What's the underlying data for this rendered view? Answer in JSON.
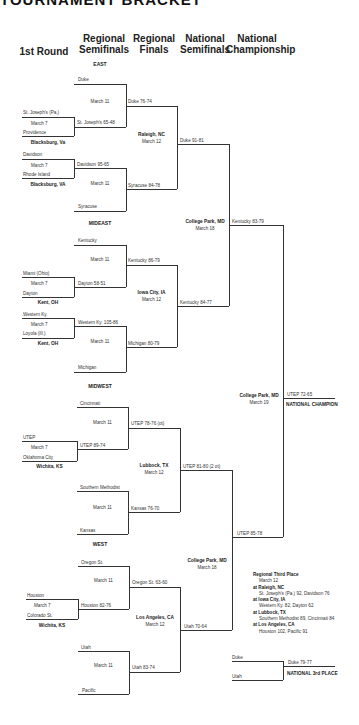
{
  "title": "TOURNAMENT BRACKET",
  "headers": [
    "1st Round",
    "Regional Semifinals",
    "Regional Finals",
    "National Semifinals",
    "National Championship"
  ],
  "regions": [
    "EAST",
    "MIDEAST",
    "MIDWEST",
    "WEST"
  ],
  "east": {
    "r1a": {
      "top": "St. Joseph's (Pa.)",
      "date": "March 7",
      "bottom": "Providence",
      "site": "Blacksburg, Va"
    },
    "r1b": {
      "top": "Davidson",
      "date": "March 7",
      "bottom": "Rhode Island",
      "site": "Blacksburg, VA"
    },
    "sf1": {
      "top": "Duke",
      "date": "March 11",
      "winner_bottom": "St. Joseph's 65-48"
    },
    "sf2": {
      "top": "Davidson 95-65",
      "date": "March 11",
      "bottom": "Syracuse"
    },
    "final": {
      "top": "Duke 76-74",
      "bottom": "Syracuse 84-78",
      "site": "Raleigh, NC",
      "date": "March 12"
    }
  },
  "mideast": {
    "r1a": {
      "top": "Miami (Ohio)",
      "date": "March 7",
      "bottom": "Dayton",
      "site": "Kent, OH"
    },
    "r1b": {
      "top": "Western Ky.",
      "date": "March 7",
      "bottom": "Loyola (Ill.)",
      "site": "Kent, OH"
    },
    "sf1": {
      "top": "Kentucky",
      "date": "March 11",
      "bottom": "Dayton 58-51"
    },
    "sf2": {
      "top": "Western Ky. 105-86",
      "date": "March 11",
      "bottom": "Michigan"
    },
    "final": {
      "top": "Kentucky 86-79",
      "bottom": "Michigan 80-79",
      "site": "Iowa City, IA",
      "date": "March 12"
    }
  },
  "midwest": {
    "r1a": {
      "top": "UTEP",
      "date": "March 7",
      "bottom": "Oklahoma City",
      "site": "Wichita, KS"
    },
    "sf1": {
      "top": "Cincinnati",
      "date": "March 11",
      "bottom": "UTEP 89-74"
    },
    "sf2": {
      "top": "Southern Methodist",
      "date": "March 11",
      "bottom": "Kansas"
    },
    "final": {
      "top": "UTEP 78-76 (ot)",
      "bottom": "Kansas 76-70",
      "site": "Lubbock, TX",
      "date": "March 12"
    }
  },
  "west": {
    "r1a": {
      "top": "Houston",
      "date": "March 7",
      "bottom": "Colorado St.",
      "site": "Wichita, KS"
    },
    "sf1": {
      "top": "Oregon St.",
      "date": "March 11",
      "bottom": "Houston 82-76"
    },
    "sf2": {
      "top": "Utah",
      "date": "March 11",
      "bottom": "Pacific"
    },
    "final": {
      "top": "Oregon St. 63-60",
      "bottom": "Utah 83-74",
      "site": "Los Angeles, CA",
      "date": "March 12"
    }
  },
  "regional_winners": {
    "east": "Duke 91-81",
    "mideast": "Kentucky 84-77",
    "midwest": "UTEP 81-80 (2 ot)",
    "west": "Utah 70-64"
  },
  "semis": {
    "top": {
      "winner": "Kentucky 83-79",
      "site": "College Park, MD",
      "date": "March 18"
    },
    "bottom": {
      "winner": "UTEP 85-78",
      "site": "College Park, MD",
      "date": "March 18"
    }
  },
  "championship": {
    "winner": "UTEP 72-65",
    "label": "NATIONAL CHAMPION",
    "site": "College Park, MD",
    "date": "March 19"
  },
  "third_place": {
    "top": "Duke",
    "bottom": "Utah",
    "winner": "Duke 79-77",
    "label": "NATIONAL 3rd PLACE"
  },
  "regional_third": {
    "title": "Regional Third Place",
    "date": "March 12",
    "games": [
      {
        "site": "at Raleigh, NC",
        "result": "St. Joseph's (Pa.) 92, Davidson 76"
      },
      {
        "site": "at Iowa City, IA",
        "result": "Western Ky. 82, Dayton 62"
      },
      {
        "site": "at Lubbock, TX",
        "result": "Southern Methodist 89, Cincinnati 84"
      },
      {
        "site": "at Los Angeles, CA",
        "result": "Houston 102, Pacific 91"
      }
    ]
  }
}
